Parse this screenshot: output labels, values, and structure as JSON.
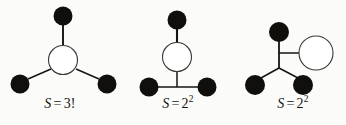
{
  "figure": {
    "background_color": "#fbfbfa",
    "ink_color": "#15140f",
    "node_fill_black": "#100f0c",
    "node_fill_white": "#ffffff",
    "width": 346,
    "height": 125
  },
  "diagrams": [
    {
      "id": "diagram-1",
      "label_prefix": "S",
      "label_equals": "=",
      "label_value": "3!",
      "label_text": "S = 3!",
      "description": "star graph with one hollow center node and three filled leaf nodes",
      "hollow_nodes": 1,
      "filled_nodes": 3,
      "edges": 3
    },
    {
      "id": "diagram-2",
      "label_prefix": "S",
      "label_equals": "=",
      "label_base": "2",
      "label_exponent": "2",
      "label_text": "S = 2^2",
      "description": "chain with hollow node between top filled node and a junction joining two filled nodes",
      "hollow_nodes": 1,
      "filled_nodes": 3,
      "edges": 4
    },
    {
      "id": "diagram-3",
      "label_prefix": "S",
      "label_equals": "=",
      "label_base": "2",
      "label_exponent": "2",
      "label_text": "S = 2^2",
      "description": "junction node with edges to one filled top-left node, one hollow right node and two filled bottom nodes",
      "hollow_nodes": 1,
      "filled_nodes": 3,
      "edges": 4
    }
  ]
}
